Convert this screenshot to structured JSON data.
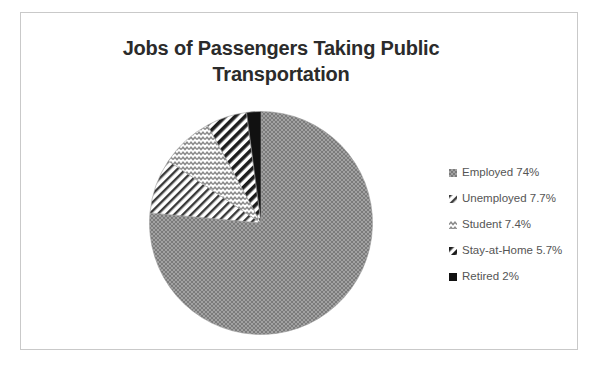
{
  "chart_data": {
    "type": "pie",
    "title": "Jobs of Passengers Taking Public Transportation",
    "title_line1": "Jobs of Passengers Taking Public",
    "title_line2": "Transportation",
    "categories": [
      "Employed",
      "Unemployed",
      "Student",
      "Stay-at-Home",
      "Retired"
    ],
    "values": [
      74,
      7.7,
      7.4,
      5.7,
      2
    ],
    "value_labels": [
      "74%",
      "7.7%",
      "7.4%",
      "5.7%",
      "2%"
    ],
    "legend_entries": [
      {
        "label": "Employed 74%",
        "name": "Employed",
        "value": 74,
        "value_label": "74%",
        "pattern": "checker",
        "color": "#8c8c8c"
      },
      {
        "label": "Unemployed 7.7%",
        "name": "Unemployed",
        "value": 7.7,
        "value_label": "7.7%",
        "pattern": "diagonal-fine",
        "color": "#6f6f6f"
      },
      {
        "label": "Student 7.4%",
        "name": "Student",
        "value": 7.4,
        "value_label": "7.4%",
        "pattern": "wave",
        "color": "#9a9a9a"
      },
      {
        "label": "Stay-at-Home 5.7%",
        "name": "Stay-at-Home",
        "value": 5.7,
        "value_label": "5.7%",
        "pattern": "diagonal-bold",
        "color": "#2e2e2e"
      },
      {
        "label": "Retired 2%",
        "name": "Retired",
        "value": 2,
        "value_label": "2%",
        "pattern": "solid",
        "color": "#111111"
      }
    ],
    "legend_position": "right",
    "start_angle_deg": 0,
    "direction": "clockwise",
    "grid": false,
    "xlabel": "",
    "ylabel": ""
  },
  "frame": {
    "border_color": "#c9c9c9",
    "background": "#ffffff"
  },
  "title_color": "#2b2b2b"
}
